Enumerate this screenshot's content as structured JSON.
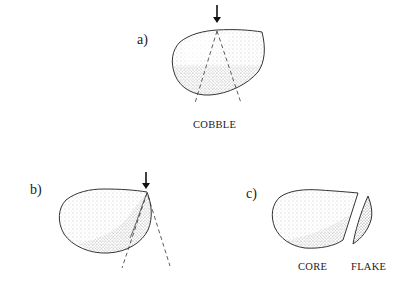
{
  "figure": {
    "panels": [
      {
        "id": "a",
        "label": "a)",
        "captions": [
          "COBBLE"
        ],
        "description": "Cobble with percussion arrow at top and diverging dashed fracture cone lines"
      },
      {
        "id": "b",
        "label": "b)",
        "captions": [],
        "description": "Percussion applied near the edge of the cobble; fracture cone runs through the margin"
      },
      {
        "id": "c",
        "label": "c)",
        "captions": [
          "CORE",
          "FLAKE"
        ],
        "description": "Cobble separated into core and detached flake"
      }
    ],
    "colors": {
      "outline": "#333333",
      "stipple": "#777777",
      "background": "#ffffff"
    }
  }
}
